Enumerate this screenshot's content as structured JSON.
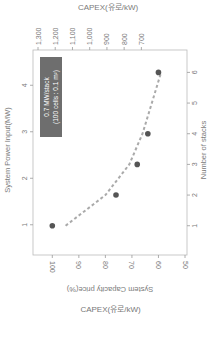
{
  "chart_data": {
    "type": "scatter",
    "orientation_note": "figure rotated 90 degrees clockwise",
    "top_axis": {
      "label": "CAPEX(유로/kW)",
      "ticks": [
        "1,300",
        "1,200",
        "1,100",
        "1,000",
        "900",
        "800",
        "700"
      ],
      "range": [
        1300,
        650
      ]
    },
    "left_axis": {
      "label": "System Power Input(MW)",
      "ticks": [
        "1",
        "2",
        "3",
        "4"
      ],
      "range": [
        0.5,
        4.5
      ]
    },
    "right_axis": {
      "label": "Number of stacks",
      "ticks": [
        "1",
        "2",
        "3",
        "4",
        "5",
        "6"
      ],
      "range": [
        0.6,
        6.6
      ]
    },
    "bottom_axis": {
      "label": "System Capacity price(%)",
      "ticks": [
        "100",
        "90",
        "80",
        "70",
        "60",
        "50"
      ],
      "range": [
        102,
        50
      ]
    },
    "series": [
      {
        "name": "data points",
        "stacks": [
          1,
          2,
          3,
          4,
          6
        ],
        "price_pct": [
          100,
          76,
          68,
          64,
          60
        ],
        "power_mw": [
          0.7,
          1.4,
          2.1,
          2.8,
          4.2
        ]
      },
      {
        "name": "trend",
        "style": "dashed",
        "stacks": [
          1,
          2,
          3,
          4,
          5,
          6
        ],
        "price_pct": [
          95,
          80,
          71,
          66,
          62.5,
          59
        ]
      }
    ],
    "annotation": {
      "line1": "0.7 MW/stack",
      "line2": "(100 cells : 0.1 m²)"
    },
    "colors": {
      "point": "#555555",
      "trend": "#aaaaaa",
      "annotation_bg": "#6e6e6e",
      "annotation_text": "#ffffff",
      "axis": "#999999"
    }
  },
  "caption": "CAPEX(유로/kW)"
}
